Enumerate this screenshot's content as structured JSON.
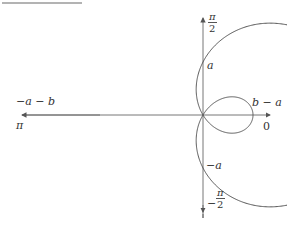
{
  "diagram": {
    "type": "polar-limacon",
    "curve": "r = |a - b cos θ| (limaçon with inner loop)",
    "colors": {
      "stroke": "#555555",
      "axis": "#666666",
      "topbar": "#9a9a9a"
    },
    "labels": {
      "top_num": "π",
      "top_den": "2",
      "bottom_sign": "−",
      "bottom_num": "π",
      "bottom_den": "2",
      "left_angle": "π",
      "right_angle": "0",
      "a_pos": "a",
      "a_neg": "−a",
      "left_extent": "−a − b",
      "right_extent": "b − a"
    }
  }
}
